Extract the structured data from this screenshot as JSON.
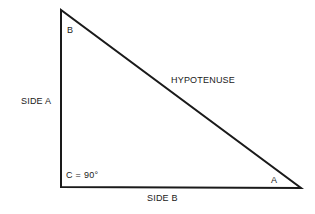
{
  "diagram": {
    "type": "right-triangle",
    "background_color": "#ffffff",
    "stroke_color": "#1a1a1a",
    "stroke_width": 2,
    "vertices": {
      "apex": {
        "x": 61,
        "y": 10
      },
      "right_angle": {
        "x": 61,
        "y": 187
      },
      "right": {
        "x": 301,
        "y": 188
      }
    },
    "labels": {
      "vertex_b": "B",
      "vertex_a": "A",
      "angle_c": "C = 90°",
      "side_a": "SIDE A",
      "side_b": "SIDE B",
      "hypotenuse": "HYPOTENUSE"
    }
  }
}
